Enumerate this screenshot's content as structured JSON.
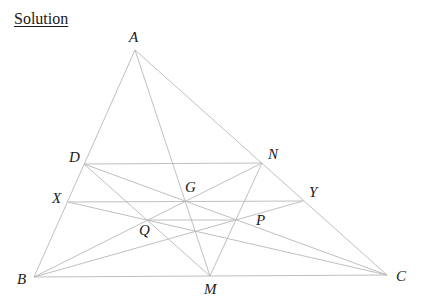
{
  "heading": "Solution",
  "diagram": {
    "line_color": "#b8b8b8",
    "label_color": "#1a1a1a",
    "points": {
      "A": {
        "label": "A",
        "x": 135,
        "y": 50
      },
      "B": {
        "label": "B",
        "x": 34,
        "y": 277
      },
      "C": {
        "label": "C",
        "x": 387,
        "y": 275
      },
      "M": {
        "label": "M",
        "x": 210,
        "y": 276
      },
      "D": {
        "label": "D",
        "x": 84,
        "y": 164
      },
      "N": {
        "label": "N",
        "x": 262,
        "y": 163
      },
      "X": {
        "label": "X",
        "x": 68,
        "y": 202
      },
      "Y": {
        "label": "Y",
        "x": 303,
        "y": 201
      },
      "G": {
        "label": "G",
        "x": 185,
        "y": 201
      },
      "Q": {
        "label": "Q",
        "x": 147,
        "y": 220
      },
      "P": {
        "label": "P",
        "x": 235,
        "y": 220
      }
    },
    "segments": [
      [
        "A",
        "B"
      ],
      [
        "A",
        "C"
      ],
      [
        "B",
        "C"
      ],
      [
        "A",
        "M"
      ],
      [
        "D",
        "N"
      ],
      [
        "X",
        "Y"
      ],
      [
        "D",
        "C"
      ],
      [
        "D",
        "M"
      ],
      [
        "X",
        "C"
      ],
      [
        "B",
        "N"
      ],
      [
        "B",
        "Y"
      ],
      [
        "N",
        "M"
      ],
      [
        "Q",
        "P"
      ]
    ]
  }
}
